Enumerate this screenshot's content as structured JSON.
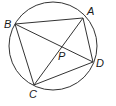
{
  "diagram": {
    "type": "geometry",
    "stroke_color": "#333333",
    "circle": {
      "cx": 53,
      "cy": 46,
      "r": 44
    },
    "points": {
      "A": {
        "x": 83,
        "y": 18,
        "label": "A",
        "lx": 87,
        "ly": 15
      },
      "B": {
        "x": 15,
        "y": 24,
        "label": "B",
        "lx": 4,
        "ly": 28
      },
      "C": {
        "x": 34,
        "y": 85,
        "label": "C",
        "lx": 29,
        "ly": 98
      },
      "D": {
        "x": 93,
        "y": 62,
        "label": "D",
        "lx": 96,
        "ly": 67
      },
      "P": {
        "x": 61,
        "y": 49,
        "label": "P",
        "lx": 58,
        "ly": 60
      }
    },
    "segments": [
      [
        "B",
        "A"
      ],
      [
        "A",
        "D"
      ],
      [
        "D",
        "C"
      ],
      [
        "C",
        "B"
      ],
      [
        "A",
        "C"
      ],
      [
        "B",
        "D"
      ]
    ]
  }
}
